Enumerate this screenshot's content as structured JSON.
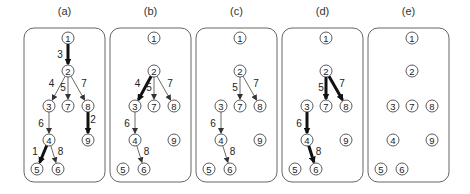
{
  "diagram": {
    "node_positions": {
      "1": [
        44,
        10
      ],
      "2": [
        44,
        43
      ],
      "3": [
        25,
        78
      ],
      "7": [
        44,
        78
      ],
      "8": [
        64,
        78
      ],
      "4": [
        25,
        112
      ],
      "9": [
        64,
        112
      ],
      "5": [
        13,
        141
      ],
      "6": [
        34,
        141
      ]
    },
    "panels": [
      {
        "label": "(a)",
        "x": 24,
        "nodes": [
          "1",
          "2",
          "3",
          "4",
          "5",
          "6",
          "7",
          "8",
          "9"
        ],
        "edges": [
          {
            "from": "1",
            "to": "2",
            "weight": "3",
            "bold": true,
            "lx": -8,
            "ly": 0
          },
          {
            "from": "2",
            "to": "3",
            "weight": "4",
            "bold": false,
            "lx": -7,
            "ly": -5
          },
          {
            "from": "2",
            "to": "7",
            "weight": "5",
            "bold": false,
            "lx": -5,
            "ly": -1
          },
          {
            "from": "2",
            "to": "8",
            "weight": "7",
            "bold": false,
            "lx": 6,
            "ly": -5
          },
          {
            "from": "8",
            "to": "9",
            "weight": "2",
            "bold": true,
            "lx": 5,
            "ly": -4
          },
          {
            "from": "3",
            "to": "4",
            "weight": "6",
            "bold": false,
            "lx": -8,
            "ly": 0
          },
          {
            "from": "4",
            "to": "5",
            "weight": "1",
            "bold": true,
            "lx": -8,
            "ly": -3
          },
          {
            "from": "4",
            "to": "6",
            "weight": "8",
            "bold": false,
            "lx": 7,
            "ly": -3
          }
        ]
      },
      {
        "label": "(b)",
        "x": 110,
        "nodes": [
          "1",
          "2",
          "3",
          "4",
          "5",
          "6",
          "7",
          "8",
          "9"
        ],
        "edges": [
          {
            "from": "2",
            "to": "3",
            "weight": "4",
            "bold": true,
            "lx": -7,
            "ly": -5
          },
          {
            "from": "2",
            "to": "7",
            "weight": "5",
            "bold": false,
            "lx": -5,
            "ly": -1
          },
          {
            "from": "2",
            "to": "8",
            "weight": "7",
            "bold": false,
            "lx": 6,
            "ly": -5
          },
          {
            "from": "3",
            "to": "4",
            "weight": "6",
            "bold": false,
            "lx": -8,
            "ly": 0
          },
          {
            "from": "4",
            "to": "6",
            "weight": "8",
            "bold": false,
            "lx": 7,
            "ly": -3
          }
        ]
      },
      {
        "label": "(c)",
        "x": 196,
        "nodes": [
          "1",
          "2",
          "3",
          "4",
          "5",
          "6",
          "7",
          "8",
          "9"
        ],
        "edges": [
          {
            "from": "2",
            "to": "7",
            "weight": "5",
            "bold": false,
            "lx": -5,
            "ly": -1
          },
          {
            "from": "2",
            "to": "8",
            "weight": "7",
            "bold": false,
            "lx": 6,
            "ly": -5
          },
          {
            "from": "3",
            "to": "4",
            "weight": "6",
            "bold": false,
            "lx": -8,
            "ly": 0
          },
          {
            "from": "4",
            "to": "6",
            "weight": "8",
            "bold": false,
            "lx": 7,
            "ly": -3
          }
        ]
      },
      {
        "label": "(d)",
        "x": 282,
        "nodes": [
          "1",
          "2",
          "3",
          "4",
          "5",
          "6",
          "7",
          "8",
          "9"
        ],
        "edges": [
          {
            "from": "2",
            "to": "7",
            "weight": "5",
            "bold": true,
            "lx": -5,
            "ly": -1
          },
          {
            "from": "2",
            "to": "8",
            "weight": "7",
            "bold": true,
            "lx": 6,
            "ly": -5
          },
          {
            "from": "3",
            "to": "4",
            "weight": "6",
            "bold": true,
            "lx": -8,
            "ly": 0
          },
          {
            "from": "4",
            "to": "6",
            "weight": "8",
            "bold": true,
            "lx": 7,
            "ly": -3
          }
        ]
      },
      {
        "label": "(e)",
        "x": 368,
        "nodes": [
          "1",
          "2",
          "3",
          "4",
          "5",
          "6",
          "7",
          "8",
          "9"
        ],
        "edges": []
      }
    ]
  }
}
